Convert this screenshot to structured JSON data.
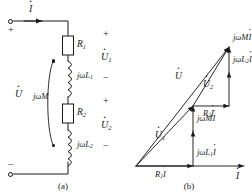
{
  "figure": {
    "subfigures": [
      {
        "id": "a",
        "caption": "(a)",
        "type": "circuit-schematic",
        "description": "Series connection of two magnetically coupled coils with resistances",
        "source_label": "U",
        "current_label": "I",
        "mutual_label": "jωM",
        "terminal_plus": "+",
        "terminal_minus": "−",
        "components": [
          {
            "name": "resistor-r1",
            "kind": "resistor",
            "label_base": "R",
            "label_sub": "1"
          },
          {
            "name": "inductor-l1",
            "kind": "inductor",
            "label_base": "jωL",
            "label_sub": "1"
          },
          {
            "name": "resistor-r2",
            "kind": "resistor",
            "label_base": "R",
            "label_sub": "2"
          },
          {
            "name": "inductor-l2",
            "kind": "inductor",
            "label_base": "jωL",
            "label_sub": "2"
          }
        ],
        "branch_voltages": [
          {
            "name": "u1",
            "base": "U",
            "sub": "1",
            "plus": "+",
            "minus": "−"
          },
          {
            "name": "u2",
            "base": "U",
            "sub": "2",
            "plus": "+",
            "minus": "−"
          }
        ]
      },
      {
        "id": "b",
        "caption": "(b)",
        "type": "phasor-diagram",
        "description": "Phasor diagram of the series coupled circuit",
        "reference_axis_label": "I",
        "phasors": [
          {
            "name": "r1i",
            "base": "R",
            "sub": "1",
            "suffix": "I",
            "kind": "component"
          },
          {
            "name": "jwl1i",
            "base": "jωL",
            "sub": "1",
            "suffix": "I",
            "kind": "component"
          },
          {
            "name": "jwmi-lower",
            "base": "jωM",
            "sub": "",
            "suffix": "I",
            "kind": "component"
          },
          {
            "name": "u1",
            "base": "U",
            "sub": "1",
            "suffix": "",
            "kind": "resultant"
          },
          {
            "name": "r2i",
            "base": "R",
            "sub": "2",
            "suffix": "I",
            "kind": "component"
          },
          {
            "name": "jwmi-upper",
            "base": "jωM",
            "sub": "",
            "suffix": "I",
            "kind": "component"
          },
          {
            "name": "jwl2i",
            "base": "jωL",
            "sub": "2",
            "suffix": "I",
            "kind": "component"
          },
          {
            "name": "u2",
            "base": "U",
            "sub": "2",
            "suffix": "",
            "kind": "resultant"
          },
          {
            "name": "u",
            "base": "U",
            "sub": "",
            "suffix": "",
            "kind": "total"
          }
        ]
      }
    ]
  },
  "style": {
    "ink": "#1a1a1a",
    "paper": "#ffffff"
  }
}
